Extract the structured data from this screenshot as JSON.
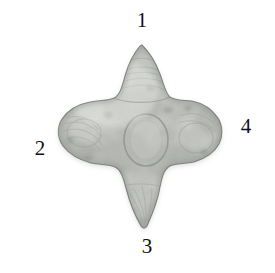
{
  "figure": {
    "background_color": "#ffffff",
    "caption_labels": [
      {
        "id": "view-1",
        "text": "1",
        "position": "top"
      },
      {
        "id": "view-2",
        "text": "2",
        "position": "left"
      },
      {
        "id": "view-3",
        "text": "3",
        "position": "bottom"
      },
      {
        "id": "view-4",
        "text": "4",
        "position": "right"
      }
    ],
    "specimen": {
      "name": "cross-shaped-stone-artifact",
      "shape": "quatrefoil",
      "base_color": "#c9cbc6",
      "highlight_color": "#eceeea",
      "shadow_color": "#8f938d",
      "outline_color": "#6e736d",
      "lobes": [
        "top",
        "left",
        "bottom",
        "right"
      ]
    }
  }
}
